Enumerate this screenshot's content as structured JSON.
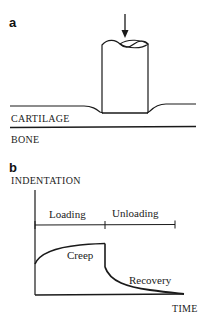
{
  "panel_a": {
    "label": "a",
    "layers": {
      "top": "CARTILAGE",
      "bottom": "BONE"
    },
    "indenter": {
      "shape": "cylinder",
      "load_direction": "down-arrow-icon"
    }
  },
  "panel_b": {
    "label": "b",
    "ylabel": "INDENTATION",
    "xlabel": "TIME",
    "phases": [
      "Loading",
      "Unloading"
    ],
    "curve_annotations": {
      "loading": "Creep",
      "unloading": "Recovery"
    }
  },
  "colors": {
    "ink": "#1a1a1a",
    "background": "#ffffff"
  }
}
